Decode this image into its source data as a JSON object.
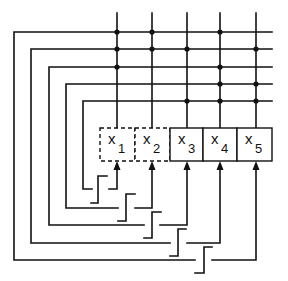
{
  "diagram": {
    "colors": {
      "line": "#111111",
      "background": "#ffffff"
    },
    "columns_x": [
      117,
      152,
      187,
      220,
      256
    ],
    "rows_y": [
      32,
      49,
      67,
      84,
      101
    ],
    "bus_top_y": 13,
    "bus_right_x": 272,
    "loops_left_x": [
      14,
      31,
      49,
      66,
      83
    ],
    "loops_bottom_y": [
      260,
      243,
      225,
      208,
      189
    ],
    "crosspoints": [
      {
        "row": 0,
        "col": 0
      },
      {
        "row": 0,
        "col": 1
      },
      {
        "row": 0,
        "col": 3
      },
      {
        "row": 1,
        "col": 0
      },
      {
        "row": 1,
        "col": 1
      },
      {
        "row": 1,
        "col": 2
      },
      {
        "row": 1,
        "col": 4
      },
      {
        "row": 2,
        "col": 0
      },
      {
        "row": 2,
        "col": 3
      },
      {
        "row": 3,
        "col": 3
      },
      {
        "row": 3,
        "col": 4
      },
      {
        "row": 4,
        "col": 2
      },
      {
        "row": 4,
        "col": 3
      },
      {
        "row": 4,
        "col": 4
      }
    ],
    "register": {
      "top_y": 128,
      "bottom_y": 161,
      "cells": [
        {
          "x0": 100,
          "x1": 135,
          "var": "x",
          "sub": "1",
          "style": "dashed"
        },
        {
          "x0": 135,
          "x1": 170,
          "var": "x",
          "sub": "2",
          "style": "dashed"
        },
        {
          "x0": 170,
          "x1": 203,
          "var": "x",
          "sub": "3",
          "style": "solid"
        },
        {
          "x0": 203,
          "x1": 237,
          "var": "x",
          "sub": "4",
          "style": "solid"
        },
        {
          "x0": 237,
          "x1": 272,
          "var": "x",
          "sub": "5",
          "style": "solid"
        }
      ]
    },
    "feedback_paths": [
      {
        "left_end_x": 195,
        "right_start_x": 212,
        "target_col": 4,
        "bottom_y": 260
      },
      {
        "left_end_x": 170,
        "right_start_x": 187,
        "target_col": 3,
        "bottom_y": 243
      },
      {
        "left_end_x": 144,
        "right_start_x": 160,
        "target_col": 2,
        "bottom_y": 225
      },
      {
        "left_end_x": 118,
        "right_start_x": 135,
        "target_col": 1,
        "bottom_y": 208
      },
      {
        "left_end_x": 92,
        "right_start_x": 109,
        "target_col": 0,
        "bottom_y": 189
      }
    ],
    "switches": [
      {
        "x_left": 91,
        "x_mid": 98,
        "x_right": 107,
        "y_bottom": 203,
        "y_top": 176
      },
      {
        "x_left": 118,
        "x_mid": 126,
        "x_right": 135,
        "y_bottom": 221,
        "y_top": 194
      },
      {
        "x_left": 144,
        "x_mid": 152,
        "x_right": 161,
        "y_bottom": 238,
        "y_top": 212
      },
      {
        "x_left": 170,
        "x_mid": 178,
        "x_right": 186,
        "y_bottom": 256,
        "y_top": 229
      },
      {
        "x_left": 195,
        "x_mid": 204,
        "x_right": 212,
        "y_bottom": 273,
        "y_top": 247
      }
    ]
  }
}
